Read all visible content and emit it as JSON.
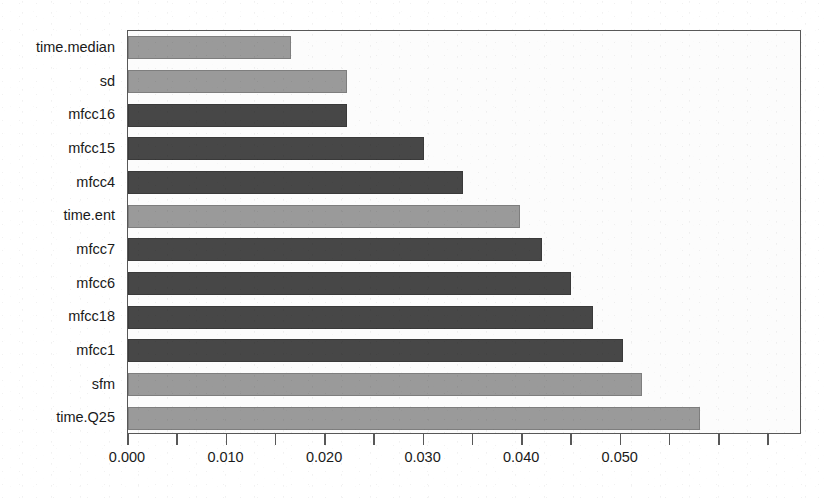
{
  "chart_data": {
    "type": "bar",
    "orientation": "horizontal",
    "title": "",
    "subtitle": "",
    "xlabel": "",
    "ylabel": "",
    "categories": [
      "time.median",
      "sd",
      "mfcc16",
      "mfcc15",
      "mfcc4",
      "time.ent",
      "mfcc7",
      "mfcc6",
      "mfcc18",
      "mfcc1",
      "sfm",
      "time.Q25"
    ],
    "values": [
      0.0165,
      0.0222,
      0.0222,
      0.03,
      0.034,
      0.0398,
      0.042,
      0.045,
      0.0472,
      0.0502,
      0.0522,
      0.058
    ],
    "bar_shades": [
      "light",
      "light",
      "dark",
      "dark",
      "dark",
      "light",
      "dark",
      "dark",
      "dark",
      "dark",
      "light",
      "light"
    ],
    "xlim": [
      0.0,
      0.0684
    ],
    "ylim": [
      0,
      12
    ],
    "xticks": [
      0.0,
      0.005,
      0.01,
      0.015,
      0.02,
      0.025,
      0.03,
      0.035,
      0.04,
      0.045,
      0.05,
      0.055,
      0.06,
      0.065
    ],
    "xtick_labels": [
      {
        "value": 0.0,
        "label": "0.000"
      },
      {
        "value": 0.01,
        "label": "0.010"
      },
      {
        "value": 0.02,
        "label": "0.020"
      },
      {
        "value": 0.03,
        "label": "0.030"
      },
      {
        "value": 0.04,
        "label": "0.040"
      },
      {
        "value": 0.05,
        "label": "0.050"
      }
    ],
    "minor_ticks": [
      0.005,
      0.015,
      0.025,
      0.035,
      0.045,
      0.055,
      0.06,
      0.065
    ],
    "grid": false,
    "legend": null,
    "annotations": [],
    "colors": {
      "bar_light": "#9a9a9a",
      "bar_dark": "#474747",
      "axis": "#585858",
      "text": "#1a1a1a",
      "plot_background": "#fcfcfc",
      "page_background": "#ffffff"
    }
  }
}
